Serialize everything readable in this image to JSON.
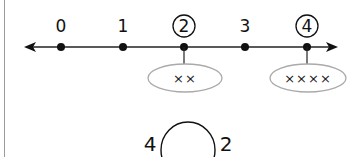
{
  "number_line": {
    "ticks": [
      "0",
      "1",
      "2",
      "3",
      "4"
    ],
    "circled": [
      "2",
      "4"
    ],
    "groups": [
      {
        "for": "2",
        "marks": "××"
      },
      {
        "for": "4",
        "marks": "××××"
      }
    ]
  },
  "comparison": {
    "left": "4",
    "right": "2",
    "blank": ""
  }
}
